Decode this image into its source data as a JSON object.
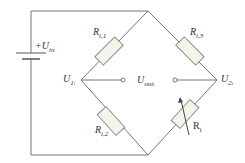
{
  "diagram": {
    "type": "wheatstone-bridge-circuit",
    "source": {
      "label": "+U",
      "sub": "in"
    },
    "resistors": [
      {
        "id": "r_i1",
        "label": "R",
        "sub": "i,1",
        "variable": false
      },
      {
        "id": "r_i3",
        "label": "R",
        "sub": "i,3",
        "variable": false
      },
      {
        "id": "r_i2",
        "label": "R",
        "sub": "i,2",
        "variable": false
      },
      {
        "id": "r_i",
        "label": "R",
        "sub": "i",
        "variable": true
      }
    ],
    "nodes": {
      "left": {
        "label": "U",
        "sub": "1",
        "subsub": "i"
      },
      "right": {
        "label": "U",
        "sub": "2",
        "subsub": "i"
      },
      "output": {
        "label": "U",
        "sub": "out",
        "subsub": "i"
      }
    },
    "colors": {
      "wire": "#777777",
      "resistor_fill": "#f2f2e8",
      "text": "#333333"
    }
  }
}
